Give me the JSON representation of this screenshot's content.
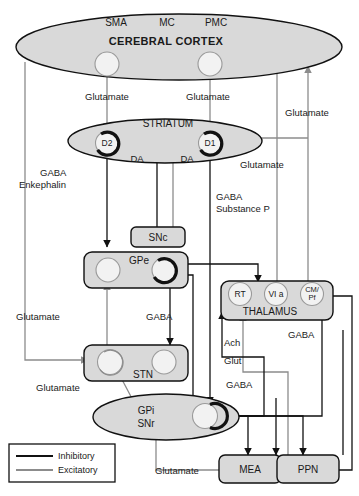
{
  "diagram": {
    "colors": {
      "inhibitory": "#111111",
      "excitatory": "#8c8c8c",
      "region_fill": "#d9d9d9",
      "circle_fill": "#f2f2f2"
    },
    "cortex": {
      "name": "CEREBRAL CORTEX",
      "areas": [
        {
          "id": "sma",
          "label": "SMA"
        },
        {
          "id": "mc",
          "label": "MC"
        },
        {
          "id": "pmc",
          "label": "PMC"
        }
      ]
    },
    "regions": [
      {
        "id": "striatum",
        "label": "STRIATUM",
        "shape": "ellipse",
        "nodes": [
          {
            "id": "d2",
            "label": "D2"
          },
          {
            "id": "d1",
            "label": "D1"
          }
        ]
      },
      {
        "id": "snc",
        "label": "SNc",
        "shape": "box",
        "nodes": []
      },
      {
        "id": "gpe",
        "label": "GPe",
        "shape": "box",
        "nodes": []
      },
      {
        "id": "stn",
        "label": "STN",
        "shape": "box",
        "nodes": []
      },
      {
        "id": "gpi_snr",
        "label_line1": "GPi",
        "label_line2": "SNr",
        "shape": "ellipse",
        "nodes": []
      },
      {
        "id": "thalamus",
        "label": "THALAMUS",
        "shape": "box",
        "nodes": [
          {
            "id": "rt",
            "label": "RT"
          },
          {
            "id": "vla",
            "label": "VI a"
          },
          {
            "id": "cmpf",
            "label_line1": "CM/",
            "label_line2": "Pf"
          }
        ]
      },
      {
        "id": "mea",
        "label": "MEA",
        "shape": "box",
        "nodes": []
      },
      {
        "id": "ppn",
        "label": "PPN",
        "shape": "box",
        "nodes": []
      }
    ],
    "neurotransmitter_labels": [
      {
        "id": "glu-cortex-d2",
        "text": "Glutamate"
      },
      {
        "id": "glu-cortex-d1",
        "text": "Glutamate"
      },
      {
        "id": "glu-thal-cortex-right",
        "text": "Glutamate"
      },
      {
        "id": "glu-cmpf-striatum",
        "text": "Glutamate"
      },
      {
        "id": "gaba-enkephalin-line1",
        "text": "GABA"
      },
      {
        "id": "gaba-enkephalin-line2",
        "text": "Enkephalin"
      },
      {
        "id": "da-left",
        "text": "DA"
      },
      {
        "id": "da-right",
        "text": "DA"
      },
      {
        "id": "gaba-substancep-line1",
        "text": "GABA"
      },
      {
        "id": "gaba-substancep-line2",
        "text": "Substance P"
      },
      {
        "id": "glu-stn-left",
        "text": "Glutamate"
      },
      {
        "id": "gaba-gpe-stn",
        "text": "GABA"
      },
      {
        "id": "glu-stn-gpi",
        "text": "Glutamate"
      },
      {
        "id": "ach-ppn-thal",
        "text": "Ach"
      },
      {
        "id": "glut-ppn-thal",
        "text": "Glut"
      },
      {
        "id": "gaba-gpi-ppn",
        "text": "GABA"
      },
      {
        "id": "gaba-gpi-thal",
        "text": "GABA"
      },
      {
        "id": "glu-mea-gpi",
        "text": "Glutamate"
      }
    ],
    "legend": {
      "items": [
        {
          "id": "inhibitory",
          "label": "Inhibitory",
          "color": "#111111"
        },
        {
          "id": "excitatory",
          "label": "Excitatory",
          "color": "#8c8c8c"
        }
      ]
    }
  }
}
